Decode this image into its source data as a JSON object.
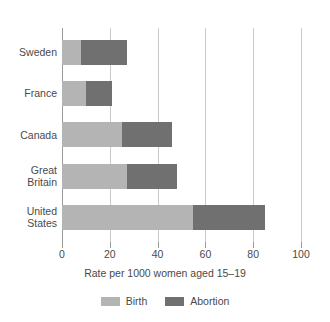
{
  "chart_data": {
    "type": "bar",
    "orientation": "horizontal",
    "stacked": true,
    "title": "",
    "xlabel": "Rate per 1000 women aged 15–19",
    "ylabel": "",
    "xlim": [
      0,
      100
    ],
    "xticks": [
      0,
      20,
      40,
      60,
      80,
      100
    ],
    "xtick_labels": [
      "0",
      "20",
      "40",
      "60",
      "80",
      "100"
    ],
    "grid": "vertical",
    "categories": [
      "Sweden",
      "France",
      "Canada",
      "Great\nBritain",
      "United\nStates"
    ],
    "series": [
      {
        "name": "Birth",
        "color": "#b4b4b4",
        "values": [
          8,
          10,
          25,
          27,
          55
        ]
      },
      {
        "name": "Abortion",
        "color": "#707070",
        "values": [
          19,
          11,
          21,
          21,
          30
        ]
      }
    ],
    "totals": [
      27,
      21,
      46,
      48,
      85
    ],
    "legend": {
      "position": "bottom",
      "entries": [
        "Birth",
        "Abortion"
      ]
    }
  },
  "colors": {
    "birth": "#b4b4b4",
    "abortion": "#707070",
    "gridline": "#c9c9c9",
    "axis": "#9a9a9a",
    "text": "#4a4a4a",
    "background": "#ffffff"
  }
}
